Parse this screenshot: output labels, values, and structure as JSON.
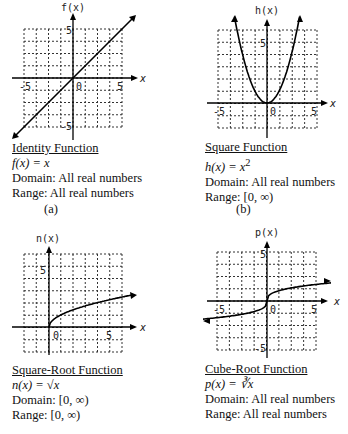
{
  "panels": [
    {
      "id": "a",
      "y_axis_label": "f(x)",
      "x_axis_label": "x",
      "title": "Identity Function",
      "equation": "f(x) = x",
      "domain": "Domain: All real numbers",
      "range": "Range: All real numbers",
      "sublabel": "(a)"
    },
    {
      "id": "b",
      "y_axis_label": "h(x)",
      "x_axis_label": "x",
      "title": "Square Function",
      "equation": "h(x) = x",
      "equation_sup": "2",
      "domain": "Domain: All real numbers",
      "range": "Range: [0, ∞)",
      "sublabel": "(b)"
    },
    {
      "id": "c",
      "y_axis_label": "n(x)",
      "x_axis_label": "x",
      "title": "Square-Root Function",
      "equation": "n(x) = √x",
      "domain": "Domain: [0, ∞)",
      "range": "Range: [0, ∞)"
    },
    {
      "id": "d",
      "y_axis_label": "p(x)",
      "x_axis_label": "x",
      "title": "Cube-Root Function",
      "equation": "p(x) = ∛x",
      "domain": "Domain: All real numbers",
      "range": "Range: All real numbers"
    }
  ],
  "ticks": {
    "neg5": "-5",
    "zero": "0",
    "pos5": "5"
  },
  "chart_data": [
    {
      "type": "line",
      "title": "Identity Function",
      "xlabel": "x",
      "ylabel": "f(x)",
      "xlim": [
        -6,
        6
      ],
      "ylim": [
        -6,
        6
      ],
      "grid": true,
      "x": [
        -6,
        -3,
        0,
        3,
        6
      ],
      "series": [
        {
          "name": "f(x)=x",
          "values": [
            -6,
            -3,
            0,
            3,
            6
          ]
        }
      ]
    },
    {
      "type": "line",
      "title": "Square Function",
      "xlabel": "x",
      "ylabel": "h(x)",
      "xlim": [
        -6,
        6
      ],
      "ylim": [
        -2,
        8
      ],
      "grid": true,
      "x": [
        -2.8,
        -2,
        -1,
        0,
        1,
        2,
        2.8
      ],
      "series": [
        {
          "name": "h(x)=x^2",
          "values": [
            7.84,
            4,
            1,
            0,
            1,
            4,
            7.84
          ]
        }
      ]
    },
    {
      "type": "line",
      "title": "Square-Root Function",
      "xlabel": "x",
      "ylabel": "n(x)",
      "xlim": [
        -2,
        6
      ],
      "ylim": [
        -2,
        6
      ],
      "grid": true,
      "x": [
        0,
        1,
        2,
        4,
        6.5
      ],
      "series": [
        {
          "name": "n(x)=sqrt(x)",
          "values": [
            0,
            1,
            1.41,
            2,
            2.55
          ]
        }
      ]
    },
    {
      "type": "line",
      "title": "Cube-Root Function",
      "xlabel": "x",
      "ylabel": "p(x)",
      "xlim": [
        -6,
        6
      ],
      "ylim": [
        -6,
        6
      ],
      "grid": true,
      "x": [
        -7,
        -1,
        0,
        1,
        7
      ],
      "series": [
        {
          "name": "p(x)=cbrt(x)",
          "values": [
            -1.91,
            -1,
            0,
            1,
            1.91
          ]
        }
      ]
    }
  ]
}
